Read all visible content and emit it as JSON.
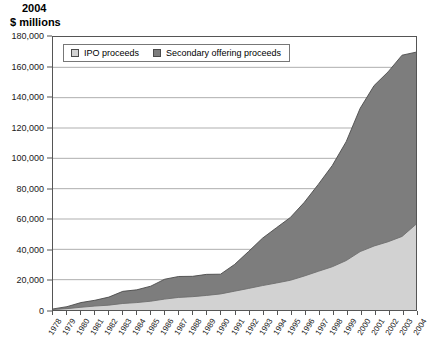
{
  "title": {
    "line1": "2004",
    "line2": "$ millions"
  },
  "legend": {
    "items": [
      {
        "label": "IPO proceeds",
        "color": "#d2d2d2",
        "key": "ipo"
      },
      {
        "label": "Secondary offering proceeds",
        "color": "#7d7d7d",
        "key": "secondary"
      }
    ]
  },
  "axes": {
    "y_ticks": [
      "0",
      "20,000",
      "40,000",
      "60,000",
      "80,000",
      "100,000",
      "120,000",
      "140,000",
      "160,000",
      "180,000"
    ],
    "x_ticks": [
      "1978",
      "1979",
      "1980",
      "1981",
      "1982",
      "1983",
      "1984",
      "1985",
      "1986",
      "1987",
      "1988",
      "1989",
      "1990",
      "1991",
      "1992",
      "1993",
      "1994",
      "1995",
      "1996",
      "1997",
      "1998",
      "1999",
      "2000",
      "2001",
      "2002",
      "2003",
      "2004"
    ]
  },
  "chart_data": {
    "type": "area",
    "stacked": true,
    "title": "2004 $ millions",
    "xlabel": "",
    "ylabel": "$ millions",
    "ylim": [
      0,
      180000
    ],
    "ytick_step": 20000,
    "grid": true,
    "legend_position": "top-left",
    "categories": [
      "1978",
      "1979",
      "1980",
      "1981",
      "1982",
      "1983",
      "1984",
      "1985",
      "1986",
      "1987",
      "1988",
      "1989",
      "1990",
      "1991",
      "1992",
      "1993",
      "1994",
      "1995",
      "1996",
      "1997",
      "1998",
      "1999",
      "2000",
      "2001",
      "2002",
      "2003",
      "2004"
    ],
    "series": [
      {
        "name": "IPO proceeds",
        "color": "#d2d2d2",
        "values": [
          300,
          900,
          1800,
          2600,
          3200,
          4300,
          4900,
          5800,
          7200,
          8300,
          8800,
          9600,
          10600,
          12400,
          14200,
          16100,
          17800,
          19600,
          22400,
          25500,
          28500,
          32600,
          38500,
          42200,
          45000,
          48500,
          56500
        ]
      },
      {
        "name": "Secondary offering proceeds",
        "color": "#7d7d7d",
        "values": [
          400,
          1300,
          3100,
          3800,
          5300,
          8000,
          8400,
          9900,
          13100,
          13800,
          13400,
          13900,
          13000,
          17600,
          24300,
          31200,
          36400,
          41400,
          48600,
          57300,
          66700,
          78400,
          94500,
          105800,
          112000,
          119500,
          113500
        ]
      }
    ],
    "totals": [
      700,
      2200,
      4900,
      6400,
      8500,
      12300,
      13300,
      15700,
      20300,
      22100,
      22200,
      23500,
      23600,
      30000,
      38500,
      47300,
      54200,
      61000,
      71000,
      82800,
      95200,
      111000,
      133000,
      148000,
      157000,
      168000,
      170000
    ]
  }
}
